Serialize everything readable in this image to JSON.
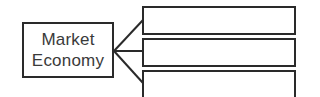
{
  "diagram": {
    "source": {
      "line1": "Market",
      "line2": "Economy"
    },
    "targets": [
      {
        "label": ""
      },
      {
        "label": ""
      },
      {
        "label": ""
      }
    ],
    "colors": {
      "stroke": "#2a2a2a",
      "text": "#3a3a3a",
      "background": "#ffffff"
    }
  }
}
